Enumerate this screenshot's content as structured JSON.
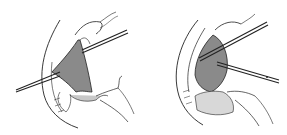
{
  "figure": {
    "panels": [
      {
        "id": "left",
        "description": "surgical-illustration-forceps-retraction"
      },
      {
        "id": "right",
        "description": "surgical-illustration-scissors-dissection"
      }
    ],
    "colors": {
      "background": "#ffffff",
      "line": "#222222",
      "tissue_shade": "#8a8a8a",
      "light_shade": "#c8c8c8"
    }
  }
}
